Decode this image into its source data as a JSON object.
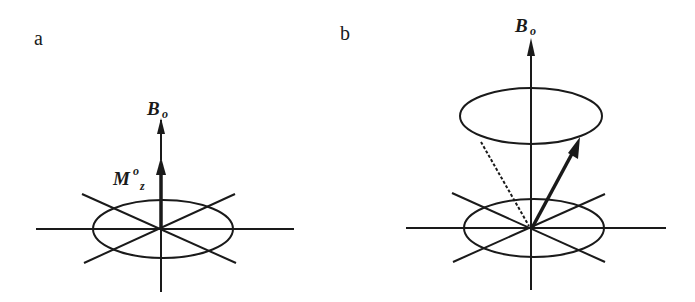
{
  "panels": [
    {
      "id": "a",
      "label": "a",
      "field_label": "B",
      "field_sub": "o",
      "magnet_label": "M",
      "magnet_sup": "o",
      "magnet_sub": "z",
      "description": "Net magnetization aligned along static field"
    },
    {
      "id": "b",
      "label": "b",
      "field_label": "B",
      "field_sub": "o",
      "description": "Magnetization precessing about static field on a cone"
    }
  ],
  "colors": {
    "line": "#1a1a1a",
    "background": "#ffffff"
  }
}
